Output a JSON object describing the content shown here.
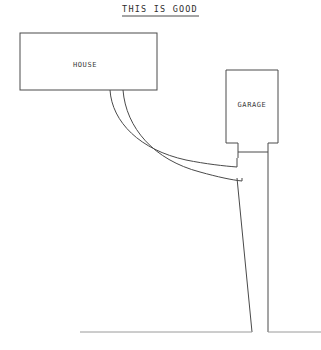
{
  "page": {
    "background_color": "#ffffff",
    "line_color": "#4a4a4a",
    "faint_line_color": "#9a9a9a",
    "width": 321,
    "height": 350
  },
  "title": {
    "text": "THIS IS GOOD",
    "underlined": true,
    "x": 160,
    "y": 12
  },
  "shapes": {
    "house": {
      "label": "HOUSE",
      "x": 20,
      "y": 33,
      "width": 137,
      "height": 57,
      "label_x": 85,
      "label_y": 67
    },
    "garage": {
      "label": "GARAGE",
      "x": 226,
      "y": 70,
      "width": 52,
      "height": 73,
      "label_x": 252,
      "label_y": 107
    },
    "driveway": {
      "left_edge_x": 238,
      "right_edge_x": 268,
      "top_y": 143,
      "bottom_y": 332
    },
    "walkway": {
      "house_start_left_x": 110,
      "house_start_right_x": 123,
      "house_start_y": 90,
      "driveway_join_upper_y": 158,
      "driveway_join_lower_y": 178
    },
    "street": {
      "y": 332,
      "left_x": 80,
      "gap_left_x": 238,
      "gap_right_x": 268,
      "right_x": 321
    }
  }
}
